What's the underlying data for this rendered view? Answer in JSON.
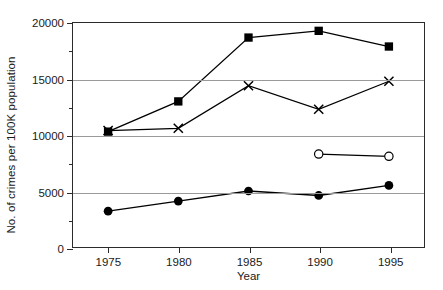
{
  "chart_data": {
    "type": "line",
    "title": "",
    "xlabel": "Year",
    "ylabel": "No. of crimes per 100K population",
    "categories": [
      1975,
      1980,
      1985,
      1990,
      1995
    ],
    "x": [
      1975,
      1980,
      1985,
      1990,
      1995
    ],
    "xlim": [
      1972.5,
      1997.5
    ],
    "ylim": [
      0,
      20000
    ],
    "xticks": [
      1975,
      1980,
      1985,
      1990,
      1995
    ],
    "xtick_labels": [
      "1975",
      "1980",
      "1985",
      "1990",
      "1995"
    ],
    "yticks": [
      0,
      5000,
      10000,
      15000,
      20000
    ],
    "ytick_labels": [
      "0",
      "5000",
      "10000",
      "15000",
      "20000"
    ],
    "yticks_minor": [
      2500,
      7500,
      12500,
      17500
    ],
    "grid": "horizontal-major",
    "legend": "none",
    "series": [
      {
        "name": "filled-square-series",
        "marker": "filled-square",
        "color": "#000000",
        "x": [
          1975,
          1980,
          1985,
          1990,
          1995
        ],
        "values": [
          10300,
          13000,
          18700,
          19300,
          17900
        ]
      },
      {
        "name": "cross-series",
        "marker": "cross",
        "color": "#000000",
        "x": [
          1975,
          1980,
          1985,
          1990,
          1995
        ],
        "values": [
          10400,
          10600,
          14400,
          12300,
          14800
        ]
      },
      {
        "name": "open-circle-series",
        "marker": "open-circle",
        "color": "#000000",
        "x": [
          1990,
          1995
        ],
        "values": [
          8300,
          8100
        ]
      },
      {
        "name": "filled-circle-series",
        "marker": "filled-circle",
        "color": "#000000",
        "x": [
          1975,
          1980,
          1985,
          1990,
          1995
        ],
        "values": [
          3200,
          4100,
          5000,
          4600,
          5500
        ]
      }
    ]
  }
}
